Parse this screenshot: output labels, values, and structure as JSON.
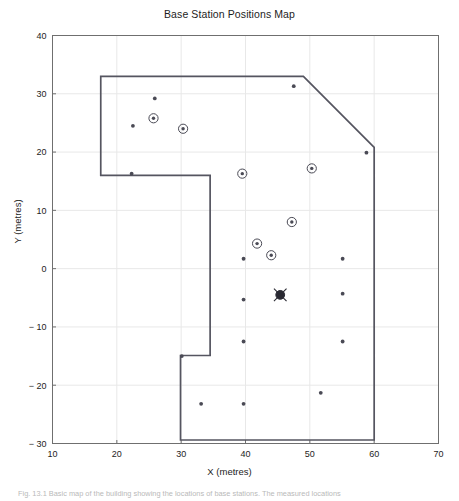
{
  "figure": {
    "caption": "Fig. 13.1  Basic map of the building showing the locations of base stations. The measured locations"
  },
  "chart_data": {
    "type": "scatter",
    "title": "Base Station Positions Map",
    "xlabel": "X (metres)",
    "ylabel": "Y (metres)",
    "xlim": [
      10,
      70
    ],
    "ylim": [
      -30,
      40
    ],
    "xticks": [
      10,
      20,
      30,
      40,
      50,
      60,
      70
    ],
    "yticks": [
      -30,
      -20,
      -10,
      0,
      10,
      20,
      30,
      40
    ],
    "grid": true,
    "grid_color": "#e8e8e8",
    "axis_color": "#6f6f6f",
    "marker_color": "#4a4a55",
    "outline_color": "#555560",
    "legend": null,
    "series": [
      {
        "name": "base-stations-ringed",
        "marker": "circled-dot",
        "points": [
          {
            "x": 25.7,
            "y": 25.8
          },
          {
            "x": 30.3,
            "y": 24.0
          },
          {
            "x": 39.5,
            "y": 16.3
          },
          {
            "x": 50.3,
            "y": 17.2
          },
          {
            "x": 47.2,
            "y": 8.0
          },
          {
            "x": 44.0,
            "y": 2.3
          },
          {
            "x": 41.8,
            "y": 4.3
          }
        ]
      },
      {
        "name": "reference-points",
        "marker": "dot",
        "points": [
          {
            "x": 25.9,
            "y": 29.2
          },
          {
            "x": 22.5,
            "y": 24.5
          },
          {
            "x": 22.3,
            "y": 16.3
          },
          {
            "x": 47.5,
            "y": 31.3
          },
          {
            "x": 58.8,
            "y": 19.9
          },
          {
            "x": 39.7,
            "y": 1.7
          },
          {
            "x": 55.1,
            "y": 1.7
          },
          {
            "x": 39.7,
            "y": -5.3
          },
          {
            "x": 55.1,
            "y": -4.3
          },
          {
            "x": 39.7,
            "y": -12.5
          },
          {
            "x": 55.1,
            "y": -12.5
          },
          {
            "x": 30.1,
            "y": -15.0
          },
          {
            "x": 33.1,
            "y": -23.2
          },
          {
            "x": 39.7,
            "y": -23.2
          },
          {
            "x": 51.7,
            "y": -21.3
          }
        ]
      },
      {
        "name": "target-marker",
        "marker": "circled-cross",
        "points": [
          {
            "x": 45.4,
            "y": -4.5
          }
        ]
      }
    ],
    "building_outline": {
      "name": "building-footprint",
      "closed": true,
      "vertices": [
        {
          "x": 17.5,
          "y": 33.0
        },
        {
          "x": 49.0,
          "y": 33.0
        },
        {
          "x": 60.0,
          "y": 20.8
        },
        {
          "x": 60.0,
          "y": -29.4
        },
        {
          "x": 29.9,
          "y": -29.4
        },
        {
          "x": 29.9,
          "y": -14.9
        },
        {
          "x": 34.5,
          "y": -14.9
        },
        {
          "x": 34.5,
          "y": 16.0
        },
        {
          "x": 17.5,
          "y": 16.0
        }
      ]
    }
  }
}
